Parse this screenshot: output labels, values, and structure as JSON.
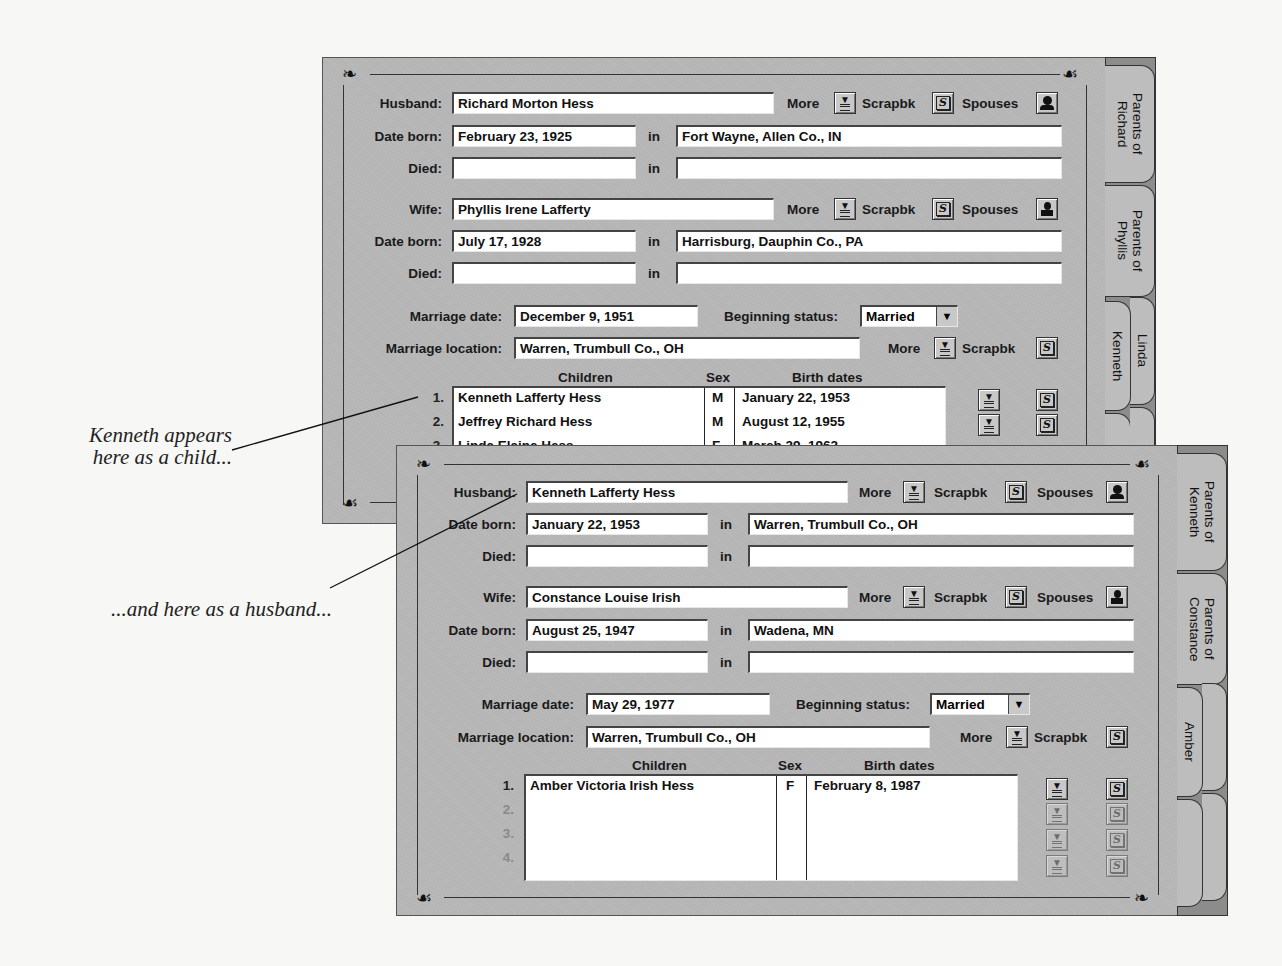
{
  "captions": {
    "child": "Kenneth appears\nhere as a child...",
    "child_line1": "Kenneth appears",
    "child_line2": "here as a child...",
    "husband": "...and here as a husband..."
  },
  "labels": {
    "husband": "Husband:",
    "wife": "Wife:",
    "date_born": "Date born:",
    "died": "Died:",
    "in": "in",
    "more": "More",
    "scrapbook": "Scrapbk",
    "spouses": "Spouses",
    "marriage_date": "Marriage date:",
    "marriage_location": "Marriage location:",
    "beginning_status": "Beginning status:",
    "children": "Children",
    "sex": "Sex",
    "birth_dates": "Birth dates"
  },
  "icons": {
    "more": "more-info-icon",
    "scrapbook": "scrapbook-icon",
    "spouses_male": "husband-spouses-icon",
    "spouses_female": "wife-spouses-icon",
    "dropdown": "dropdown-arrow-icon"
  },
  "back_window": {
    "husband": {
      "name": "Richard Morton Hess",
      "born_date": "February 23, 1925",
      "born_place": "Fort Wayne, Allen Co., IN",
      "died_date": "",
      "died_place": ""
    },
    "wife": {
      "name": "Phyllis Irene Lafferty",
      "born_date": "July 17, 1928",
      "born_place": "Harrisburg, Dauphin Co., PA",
      "died_date": "",
      "died_place": ""
    },
    "marriage_date": "December 9, 1951",
    "marriage_location": "Warren, Trumbull Co., OH",
    "beginning_status": "Married",
    "children": [
      {
        "num": "1.",
        "name": "Kenneth Lafferty Hess",
        "sex": "M",
        "birth": "January 22, 1953"
      },
      {
        "num": "2.",
        "name": "Jeffrey Richard Hess",
        "sex": "M",
        "birth": "August 12, 1955"
      },
      {
        "num": "3.",
        "name": "Linda Elaine Hess",
        "sex": "F",
        "birth": "March 29, 1962"
      }
    ],
    "tabs": [
      {
        "label": "Parents of\nRichard"
      },
      {
        "label": "Parents of\nPhyllis"
      },
      {
        "label": "Kenneth"
      },
      {
        "label": "Linda"
      },
      {
        "label": "J"
      }
    ]
  },
  "front_window": {
    "husband": {
      "name": "Kenneth Lafferty Hess",
      "born_date": "January 22, 1953",
      "born_place": "Warren, Trumbull Co., OH",
      "died_date": "",
      "died_place": ""
    },
    "wife": {
      "name": "Constance Louise Irish",
      "born_date": "August 25, 1947",
      "born_place": "Wadena, MN",
      "died_date": "",
      "died_place": ""
    },
    "marriage_date": "May 29, 1977",
    "marriage_location": "Warren, Trumbull Co., OH",
    "beginning_status": "Married",
    "children": [
      {
        "num": "1.",
        "name": "Amber Victoria Irish Hess",
        "sex": "F",
        "birth": "February 8, 1987"
      },
      {
        "num": "2.",
        "name": "",
        "sex": "",
        "birth": ""
      },
      {
        "num": "3.",
        "name": "",
        "sex": "",
        "birth": ""
      },
      {
        "num": "4.",
        "name": "",
        "sex": "",
        "birth": ""
      }
    ],
    "tabs": [
      {
        "label": "Parents of\nKenneth"
      },
      {
        "label": "Parents of\nConstance"
      },
      {
        "label": "Amber"
      },
      {
        "label": ""
      },
      {
        "label": ""
      }
    ]
  }
}
